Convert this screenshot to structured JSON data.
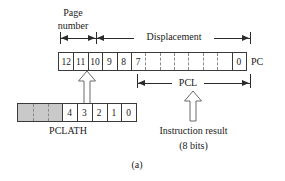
{
  "figure": {
    "caption": "(a)",
    "type": "register-bit-field-diagram"
  },
  "annotations": {
    "page_number_line1": "Page",
    "page_number_line2": "number",
    "displacement": "Displacement",
    "pcl": "PCL",
    "instruction_result_line1": "Instruction result",
    "instruction_result_line2": "(8 bits)"
  },
  "registers": {
    "pc": {
      "label": "PC",
      "bits": [
        "12",
        "11",
        "10",
        "9",
        "8",
        "7",
        "",
        "",
        "",
        "",
        "",
        "",
        "0"
      ]
    },
    "pclath": {
      "label": "PCLATH",
      "bits": [
        "",
        "",
        "",
        "4",
        "3",
        "2",
        "1",
        "0"
      ]
    }
  },
  "colors": {
    "ink": "#1a1a1a",
    "line": "#2b2b2b",
    "shade": "#c9c9c9",
    "dash": "#8a8a8a",
    "paper": "#ffffff"
  }
}
